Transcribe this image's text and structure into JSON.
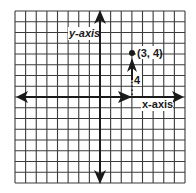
{
  "diagram": {
    "type": "coordinate-grid",
    "grid": {
      "columns": 16,
      "rows": 16,
      "line_color": "#3a3a3a",
      "background": "#ffffff"
    },
    "origin_cell": {
      "col": 8,
      "row": 8
    },
    "axes": {
      "x_label": "x-axis",
      "y_label": "y-axis"
    },
    "point": {
      "label": "(3, 4)",
      "x": 3,
      "y": 4
    },
    "path": {
      "horizontal_move": 3,
      "vertical_move": 4,
      "vertical_label": "4",
      "horizontal_style": "dotted"
    },
    "colors": {
      "ink": "#1a1a1a"
    }
  }
}
